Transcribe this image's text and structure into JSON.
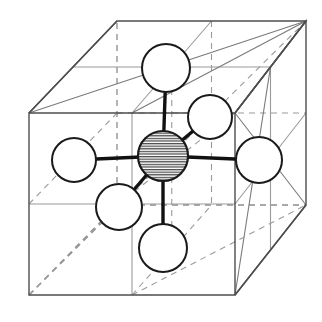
{
  "figure": {
    "title": "Octahedral coordination of a central atom within a cubic unit cell",
    "type": "crystal-structure-diagram",
    "width": 322,
    "height": 322,
    "background_color": "#ffffff"
  },
  "style": {
    "visible_edge_color": "#4d4d4d",
    "hidden_edge_color": "#8c8c8c",
    "internal_line_color": "#9a9a9a",
    "atom_outline_color": "#1a1a1a",
    "atom_fill_color": "#ffffff",
    "bond_color": "#111111",
    "hatch_color": "#444444",
    "visible_edge_width": 1.4,
    "hidden_edge_width": 1.3,
    "internal_line_width": 1.1,
    "atom_outline_width": 2.0,
    "bond_width": 3.4,
    "hidden_dash_pattern": "6,5",
    "hatch_spacing": 2.6
  },
  "geometry": {
    "cube": {
      "front_face": {
        "top_left": [
          29,
          113
        ],
        "top_right": [
          235,
          113
        ],
        "bottom_right": [
          235,
          295
        ],
        "bottom_left": [
          29,
          295
        ]
      },
      "back_face": {
        "top_left": [
          117,
          21
        ],
        "top_right": [
          306,
          21
        ],
        "bottom_right": [
          306,
          205
        ],
        "bottom_left": [
          117,
          205
        ]
      },
      "depth_offset": [
        88,
        -92
      ],
      "front_width": 206,
      "front_height": 182
    },
    "hidden_corner": "back_bottom_left"
  },
  "atoms": {
    "central": {
      "label": "central-atom",
      "role": "coordination-center",
      "fill_style": "horizontal-hatch",
      "cx": 163,
      "cy": 156,
      "r": 25
    },
    "ligands": [
      {
        "label": "ligand-atom-top",
        "direction": "up",
        "fill_style": "plain",
        "cx": 166,
        "cy": 68,
        "r": 24
      },
      {
        "label": "ligand-atom-bottom",
        "direction": "down",
        "fill_style": "plain",
        "cx": 163,
        "cy": 248,
        "r": 24
      },
      {
        "label": "ligand-atom-left",
        "direction": "left",
        "fill_style": "plain",
        "cx": 74,
        "cy": 160,
        "r": 22
      },
      {
        "label": "ligand-atom-right",
        "direction": "right",
        "fill_style": "plain",
        "cx": 259,
        "cy": 160,
        "r": 23
      },
      {
        "label": "ligand-atom-back-upper",
        "direction": "back (depth)",
        "fill_style": "plain",
        "cx": 210,
        "cy": 117,
        "r": 22
      },
      {
        "label": "ligand-atom-front-lower",
        "direction": "front (depth)",
        "fill_style": "plain",
        "cx": 119,
        "cy": 207,
        "r": 23
      }
    ],
    "bonds": [
      {
        "label": "bond-center-top",
        "from": "central",
        "to": "ligand-atom-top"
      },
      {
        "label": "bond-center-bottom",
        "from": "central",
        "to": "ligand-atom-bottom"
      },
      {
        "label": "bond-center-left",
        "from": "central",
        "to": "ligand-atom-left"
      },
      {
        "label": "bond-center-right",
        "from": "central",
        "to": "ligand-atom-right"
      },
      {
        "label": "bond-center-back",
        "from": "central",
        "to": "ligand-atom-back-upper"
      },
      {
        "label": "bond-center-front",
        "from": "central",
        "to": "ligand-atom-front-lower"
      }
    ],
    "coordination_number": 6,
    "ligand_count": 6,
    "geometry_name": "octahedral"
  }
}
